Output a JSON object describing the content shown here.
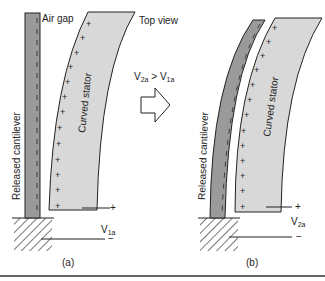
{
  "figure": {
    "panel_a": {
      "label": "(a)",
      "air_gap_label": "Air gap",
      "cantilever_label": "Released cantilever",
      "stator_label": "Curved stator",
      "voltage_main": "V",
      "voltage_sub": "1a",
      "plus": "+",
      "minus": "−"
    },
    "panel_b": {
      "label": "(b)",
      "top_view_label": "Top view",
      "cantilever_label": "Released cantilever",
      "stator_label": "Curved stator",
      "voltage_main": "V",
      "voltage_sub": "2a",
      "plus": "+",
      "minus": "−"
    },
    "transition": {
      "v2": "V",
      "v2_sub": "2a",
      "op": " > ",
      "v1": "V",
      "v1_sub": "1a"
    },
    "colors": {
      "cantilever": "#9a9a9a",
      "stator": "#d8d8d8",
      "outline": "#222222"
    }
  }
}
